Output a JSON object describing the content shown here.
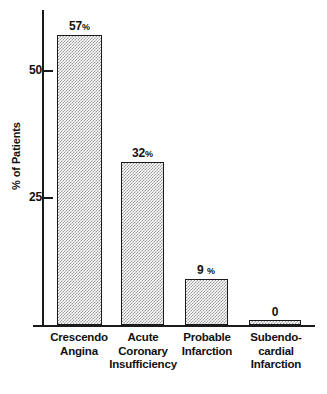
{
  "chart_data": {
    "type": "bar",
    "title": "",
    "subtitle": "",
    "xlabel": "",
    "ylabel": "% of Patients",
    "ylim": [
      0,
      62
    ],
    "grid": false,
    "legend": "none",
    "categories": [
      "Crescendo Angina",
      "Acute Coronary Insufficiency",
      "Probable Infarction",
      "Subendocardial Infarction"
    ],
    "category_lines": [
      [
        "Crescendo",
        "Angina"
      ],
      [
        "Acute",
        "Coronary",
        "Insufficiency"
      ],
      [
        "Probable",
        "Infarction"
      ],
      [
        "Subendo-",
        "cardial",
        "Infarction"
      ]
    ],
    "values": [
      57,
      32,
      9,
      0
    ],
    "value_labels": [
      "57%",
      "32%",
      "9 %",
      "0"
    ],
    "value_numbers": [
      "57",
      "32",
      "9",
      "0"
    ],
    "value_suffixes": [
      "%",
      "%",
      "%",
      ""
    ],
    "y_ticks": [
      25,
      50
    ],
    "y_tick_labels": [
      "25",
      "50"
    ],
    "colors": {
      "axis": "#1a1a1a",
      "bar_fill": "#c9c9c9",
      "bar_edge": "#1a1a1a",
      "text": "#111111",
      "background": "#ffffff"
    }
  },
  "axis": {
    "y_title": "% of Patients",
    "ticks": [
      {
        "label": "50",
        "value": 50
      },
      {
        "label": "25",
        "value": 25
      }
    ]
  },
  "bars": [
    {
      "label": "Crescendo Angina",
      "lines": [
        "Crescendo",
        "Angina"
      ],
      "value": 57,
      "value_number": "57",
      "value_suffix": "%",
      "value_label": "57%"
    },
    {
      "label": "Acute Coronary Insufficiency",
      "lines": [
        "Acute",
        "Coronary",
        "Insufficiency"
      ],
      "value": 32,
      "value_number": "32",
      "value_suffix": "%",
      "value_label": "32%"
    },
    {
      "label": "Probable Infarction",
      "lines": [
        "Probable",
        "Infarction"
      ],
      "value": 9,
      "value_number": "9",
      "value_suffix": "%",
      "value_label": "9 %"
    },
    {
      "label": "Subendocardial Infarction",
      "lines": [
        "Subendo-",
        "cardial",
        "Infarction"
      ],
      "value": 0,
      "value_number": "0",
      "value_suffix": "",
      "value_label": "0"
    }
  ]
}
